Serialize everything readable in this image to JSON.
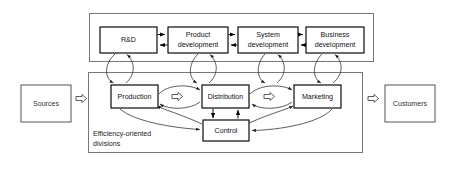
{
  "diagram": {
    "groups": {
      "development_group": {
        "name": "development-tier",
        "label": ""
      },
      "efficiency_group": {
        "name": "efficiency-tier",
        "caption_line1": "Efficiency-oriented",
        "caption_line2": "divisions"
      }
    },
    "development_nodes": [
      {
        "id": "rd",
        "label": "R&D",
        "label2": "",
        "x": 100,
        "y": 27,
        "w": 57,
        "h": 26
      },
      {
        "id": "product-development",
        "label": "Product",
        "label2": "development",
        "x": 168,
        "y": 27,
        "w": 60,
        "h": 26
      },
      {
        "id": "system-development",
        "label": "System",
        "label2": "development",
        "x": 238,
        "y": 27,
        "w": 60,
        "h": 26
      },
      {
        "id": "business-development",
        "label": "Business",
        "label2": "development",
        "x": 306,
        "y": 27,
        "w": 58,
        "h": 26
      }
    ],
    "efficiency_nodes": [
      {
        "id": "production",
        "label": "Production",
        "x": 111,
        "y": 85,
        "w": 47,
        "h": 23
      },
      {
        "id": "distribution",
        "label": "Distribution",
        "x": 202,
        "y": 85,
        "w": 47,
        "h": 23
      },
      {
        "id": "marketing",
        "label": "Marketing",
        "x": 294,
        "y": 85,
        "w": 47,
        "h": 23
      },
      {
        "id": "control",
        "label": "Control",
        "x": 203,
        "y": 120,
        "w": 46,
        "h": 21
      }
    ],
    "external_nodes": [
      {
        "id": "sources",
        "label": "Sources",
        "x": 21,
        "y": 85,
        "w": 50,
        "h": 37
      },
      {
        "id": "customers",
        "label": "Customers",
        "x": 385,
        "y": 85,
        "w": 50,
        "h": 37
      }
    ],
    "hollow_arrows": [
      {
        "id": "sources-to-efficiency",
        "x": 76,
        "y": 99,
        "direction": "right"
      },
      {
        "id": "production-to-distribution",
        "x": 172,
        "y": 93,
        "direction": "right"
      },
      {
        "id": "distribution-to-marketing",
        "x": 264,
        "y": 93,
        "direction": "right"
      },
      {
        "id": "efficiency-to-customers",
        "x": 368,
        "y": 99,
        "direction": "right"
      }
    ],
    "colors": {
      "node_stroke": "#000000",
      "group_stroke": "#777777",
      "external_stroke": "#555555",
      "background": "#ffffff",
      "text": "#111111"
    }
  }
}
